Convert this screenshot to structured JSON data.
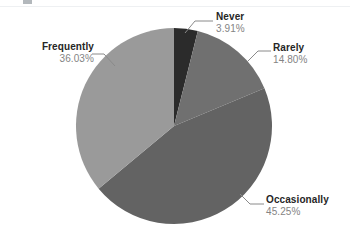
{
  "canvas": {
    "width": 350,
    "height": 239,
    "background": "#ffffff"
  },
  "chart_data": {
    "type": "pie",
    "title": "",
    "subtitle": "",
    "xlabel": "",
    "ylabel": "",
    "legend_position": "none",
    "labels_position": "outside-with-leader-lines",
    "grid": false,
    "start_angle_deg": 0,
    "direction": "clockwise",
    "categories": [
      "Never",
      "Rarely",
      "Occasionally",
      "Frequently"
    ],
    "values": [
      3.91,
      14.8,
      45.25,
      36.03
    ],
    "value_suffix": "%",
    "colors": [
      "#2b2b2b",
      "#707070",
      "#636363",
      "#9a9a9a"
    ],
    "slices": [
      {
        "label": "Never",
        "value": 3.91,
        "value_text": "3.91%",
        "color": "#2b2b2b"
      },
      {
        "label": "Rarely",
        "value": 14.8,
        "value_text": "14.80%",
        "color": "#707070"
      },
      {
        "label": "Occasionally",
        "value": 45.25,
        "value_text": "45.25%",
        "color": "#636363"
      },
      {
        "label": "Frequently",
        "value": 36.03,
        "value_text": "36.03%",
        "color": "#9a9a9a"
      }
    ]
  },
  "labels": {
    "never": {
      "name": "Never",
      "value": "3.91%"
    },
    "rarely": {
      "name": "Rarely",
      "value": "14.80%"
    },
    "occasionally": {
      "name": "Occasionally",
      "value": "45.25%"
    },
    "frequently": {
      "name": "Frequently",
      "value": "36.03%"
    }
  },
  "colors": {
    "label_text": "#262626",
    "value_text": "#848484",
    "leader_line": "#8a8a8a",
    "background": "#ffffff"
  }
}
